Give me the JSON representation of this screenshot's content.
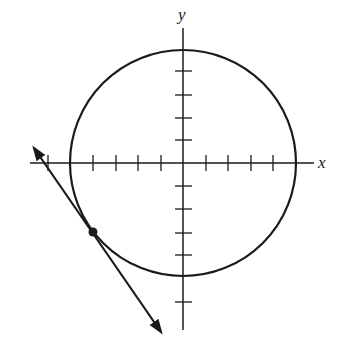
{
  "diagram": {
    "type": "circle-with-tangent-line",
    "axes": {
      "x_label": "x",
      "y_label": "y",
      "origin_px": [
        183,
        163
      ],
      "unit_px": 22.6,
      "x_ticks": [
        -6,
        -5,
        -4,
        -3,
        -2,
        -1,
        1,
        2,
        3,
        4,
        5
      ],
      "y_ticks": [
        6,
        5,
        4,
        3,
        2,
        1,
        -1,
        -2,
        -3,
        -4,
        -5,
        -6
      ]
    },
    "circle": {
      "center": [
        0,
        0
      ],
      "radius": 5
    },
    "tangent_point": [
      -4,
      -3
    ],
    "tangent_line": {
      "direction": "arrows-both-ends",
      "slope": 1.333
    },
    "colors": {
      "stroke": "#1a1a1a",
      "background": "#ffffff"
    }
  }
}
